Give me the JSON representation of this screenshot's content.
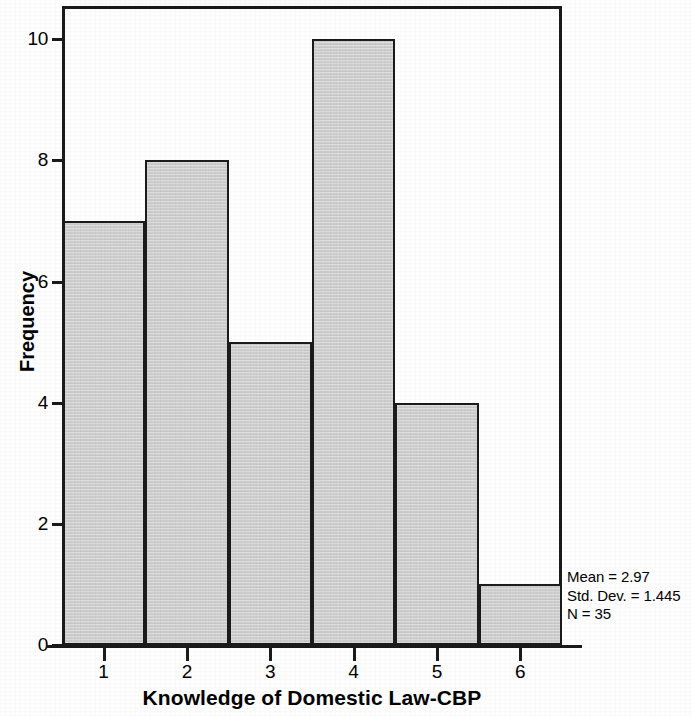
{
  "chart_data": {
    "type": "bar",
    "title": "",
    "subtitle": "",
    "xlabel": "Knowledge of Domestic Law-CBP",
    "ylabel": "Frequency",
    "categories": [
      "1",
      "2",
      "3",
      "4",
      "5",
      "6"
    ],
    "values": [
      7,
      8,
      5,
      10,
      4,
      1
    ],
    "x_tick_labels": [
      "1",
      "2",
      "3",
      "4",
      "5",
      "6"
    ],
    "y_tick_labels": [
      "0",
      "2",
      "4",
      "6",
      "8",
      "10"
    ],
    "y_ticks": [
      0,
      2,
      4,
      6,
      8,
      10
    ],
    "xlim": [
      0.5,
      6.5
    ],
    "ylim": [
      0,
      10.55
    ],
    "grid": false,
    "legend": false,
    "legend_position": "none",
    "bar_fill_color": "#cfcfcf",
    "bar_edge_color": "#1a1a1a",
    "axis_color": "#1a1a1a",
    "background_color": "#ffffff",
    "annotations": {
      "mean_label": "Mean = 2.97",
      "std_dev_label": "Std. Dev. = 1.445",
      "n_label": "N = 35",
      "mean_value": 2.97,
      "std_dev_value": 1.445,
      "n_value": 35
    }
  }
}
